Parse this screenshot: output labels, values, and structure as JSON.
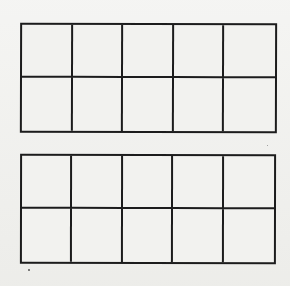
{
  "page": {
    "background_color": "#efefec",
    "line_color": "#1c1c1c",
    "bleed_through_text": "squares"
  },
  "ten_frames": [
    {
      "id": "top",
      "rows": 2,
      "columns": 5,
      "filled_cells": 0
    },
    {
      "id": "bottom",
      "rows": 2,
      "columns": 5,
      "filled_cells": 0
    }
  ]
}
